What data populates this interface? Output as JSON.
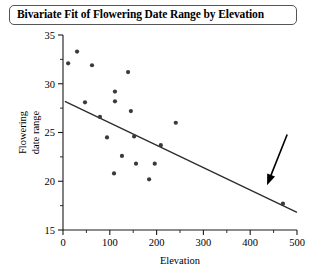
{
  "title": "Bivariate Fit of Flowering Date Range by Elevation",
  "axes": {
    "x": {
      "label": "Elevation",
      "ticks": [
        0,
        100,
        200,
        300,
        400,
        500
      ],
      "min": 0,
      "max": 500
    },
    "y": {
      "label_line1": "Flowering",
      "label_line2": "date range",
      "ticks": [
        15,
        20,
        25,
        30,
        35
      ],
      "min": 15,
      "max": 35
    }
  },
  "annotation": {
    "name": "arrow-pointing-to-outlier",
    "tail_x": 479,
    "tail_y": 24.8,
    "tip_x": 436,
    "tip_y": 19.6
  },
  "chart_data": {
    "type": "scatter",
    "title": "Bivariate Fit of Flowering Date Range by Elevation",
    "xlabel": "Elevation",
    "ylabel": "Flowering date range",
    "xlim": [
      0,
      500
    ],
    "ylim": [
      15,
      35
    ],
    "xticks": [
      0,
      100,
      200,
      300,
      400,
      500
    ],
    "yticks": [
      15,
      20,
      25,
      30,
      35
    ],
    "grid": false,
    "legend": false,
    "points": [
      {
        "x": 30,
        "y": 33.3
      },
      {
        "x": 11,
        "y": 32.1
      },
      {
        "x": 62,
        "y": 31.9
      },
      {
        "x": 139,
        "y": 31.2
      },
      {
        "x": 111,
        "y": 29.2
      },
      {
        "x": 111,
        "y": 28.2
      },
      {
        "x": 47,
        "y": 28.1
      },
      {
        "x": 79,
        "y": 26.6
      },
      {
        "x": 145,
        "y": 27.2
      },
      {
        "x": 241,
        "y": 26.0
      },
      {
        "x": 94,
        "y": 24.5
      },
      {
        "x": 152,
        "y": 24.6
      },
      {
        "x": 209,
        "y": 23.7
      },
      {
        "x": 126,
        "y": 22.6
      },
      {
        "x": 156,
        "y": 21.8
      },
      {
        "x": 196,
        "y": 21.8
      },
      {
        "x": 109,
        "y": 20.8
      },
      {
        "x": 470,
        "y": 17.7
      },
      {
        "x": 184,
        "y": 20.2
      }
    ],
    "fit_line": {
      "name": "linear-regression-line",
      "x1": 4,
      "y1": 28.2,
      "x2": 500,
      "y2": 16.8
    }
  }
}
